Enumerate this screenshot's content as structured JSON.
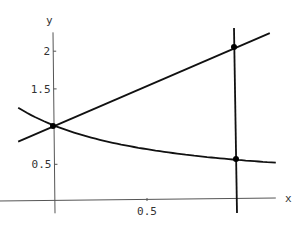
{
  "chart_data": {
    "type": "line",
    "title": "",
    "xlabel": "x",
    "ylabel": "y",
    "xlim": [
      -0.2,
      1.2
    ],
    "ylim": [
      -0.15,
      2.25
    ],
    "grid": false,
    "legend": null,
    "x_ticks": [
      {
        "value": 0.5,
        "label": "0.5"
      }
    ],
    "y_ticks": [
      {
        "value": 0.5,
        "label": "0.5"
      },
      {
        "value": 1.5,
        "label": "1.5"
      },
      {
        "value": 2,
        "label": "2"
      }
    ],
    "series": [
      {
        "name": "increasing line",
        "formula": "y = 1 + x",
        "x": [
          -0.2,
          0,
          1,
          1.2
        ],
        "y": [
          0.8,
          1,
          2,
          2.2
        ]
      },
      {
        "name": "decreasing curve",
        "formula": "y = 1/(1+x)",
        "x": [
          -0.2,
          0,
          0.5,
          1,
          1.2
        ],
        "y": [
          1.25,
          1,
          0.667,
          0.5,
          0.455
        ]
      },
      {
        "name": "vertical line",
        "formula": "x = 1",
        "x": [
          1,
          1
        ],
        "y": [
          -0.15,
          2.3
        ]
      }
    ],
    "points": [
      {
        "x": 0,
        "y": 1
      },
      {
        "x": 1,
        "y": 2
      },
      {
        "x": 1,
        "y": 0.5
      }
    ],
    "colors": {
      "axes": "#555555",
      "curves": "#111111",
      "text": "#333333"
    }
  }
}
